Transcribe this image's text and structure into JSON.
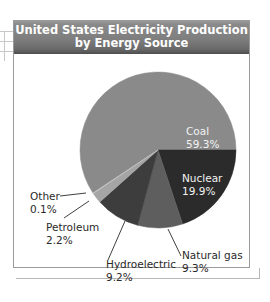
{
  "chart_data": {
    "type": "pie",
    "title": "United States Electricity Production by Energy Source",
    "title_lines": [
      "United States Electricity Production",
      "by Energy Source"
    ],
    "categories": [
      "Coal",
      "Nuclear",
      "Natural gas",
      "Hydroelectric",
      "Petroleum",
      "Other"
    ],
    "values": [
      59.3,
      19.9,
      9.3,
      9.2,
      2.2,
      0.1
    ],
    "unit": "%",
    "slices": [
      {
        "label": "Coal",
        "value": 59.3,
        "display": "59.3%",
        "color": "#8a8a8a"
      },
      {
        "label": "Nuclear",
        "value": 19.9,
        "display": "19.9%",
        "color": "#2b2b2b"
      },
      {
        "label": "Natural gas",
        "value": 9.3,
        "display": "9.3%",
        "color": "#5e5e5e"
      },
      {
        "label": "Hydroelectric",
        "value": 9.2,
        "display": "9.2%",
        "color": "#3d3d3d"
      },
      {
        "label": "Petroleum",
        "value": 2.2,
        "display": "2.2%",
        "color": "#a5a5a5"
      },
      {
        "label": "Other",
        "value": 0.1,
        "display": "0.1%",
        "color": "#c4c4c4"
      }
    ],
    "legend": "none (labels on/next to slices)",
    "grid": false
  },
  "labels": {
    "coal": {
      "name": "Coal",
      "pct": "59.3%"
    },
    "nuclear": {
      "name": "Nuclear",
      "pct": "19.9%"
    },
    "natural_gas": {
      "name": "Natural gas",
      "pct": "9.3%"
    },
    "hydroelectric": {
      "name": "Hydroelectric",
      "pct": "9.2%"
    },
    "petroleum": {
      "name": "Petroleum",
      "pct": "2.2%"
    },
    "other": {
      "name": "Other",
      "pct": "0.1%"
    }
  }
}
